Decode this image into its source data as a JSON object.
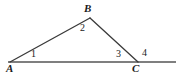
{
  "figure": {
    "background_color": "#ffffff",
    "stroke_color": "#3a3a3a",
    "base_line_color": "#555555",
    "text_color": "#1b1b1b",
    "width": 181,
    "height": 75
  },
  "vertices": [
    {
      "id": "A",
      "label": "A",
      "x": 10,
      "y": 62
    },
    {
      "id": "B",
      "label": "B",
      "x": 90,
      "y": 18
    },
    {
      "id": "C",
      "label": "C",
      "x": 138,
      "y": 62
    }
  ],
  "angles": [
    {
      "id": "angle1",
      "label": "1",
      "at_vertex": "A",
      "kind": "interior",
      "x": 34,
      "y": 54
    },
    {
      "id": "angle2",
      "label": "2",
      "at_vertex": "B",
      "kind": "interior",
      "x": 83,
      "y": 28
    },
    {
      "id": "angle3",
      "label": "3",
      "at_vertex": "C",
      "kind": "interior",
      "x": 119,
      "y": 54
    },
    {
      "id": "angle4",
      "label": "4",
      "at_vertex": "C",
      "kind": "exterior",
      "x": 145,
      "y": 53
    }
  ],
  "segments": [
    {
      "id": "side-AB",
      "from": "A",
      "to": "B",
      "x1": 10,
      "y1": 62,
      "x2": 90,
      "y2": 18
    },
    {
      "id": "side-BC",
      "from": "B",
      "to": "C",
      "x1": 90,
      "y1": 18,
      "x2": 138,
      "y2": 62
    },
    {
      "id": "base-line",
      "from": "left-end",
      "to": "right-end",
      "x1": 8,
      "y1": 62,
      "x2": 176,
      "y2": 62
    }
  ],
  "chart_data": {
    "type": "diagram",
    "points": {
      "A": [
        10,
        62
      ],
      "B": [
        90,
        18
      ],
      "C": [
        138,
        62
      ],
      "base_left_end": [
        8,
        62
      ],
      "base_right_end": [
        176,
        62
      ]
    },
    "edges": [
      [
        "A",
        "B"
      ],
      [
        "B",
        "C"
      ],
      [
        "base_left_end",
        "base_right_end"
      ]
    ],
    "annotations": [
      {
        "text": "A",
        "x": 10,
        "y": 70,
        "role": "vertex-label"
      },
      {
        "text": "B",
        "x": 88,
        "y": 10,
        "role": "vertex-label"
      },
      {
        "text": "C",
        "x": 136,
        "y": 70,
        "role": "vertex-label"
      },
      {
        "text": "1",
        "x": 34,
        "y": 56,
        "role": "angle-number"
      },
      {
        "text": "2",
        "x": 83,
        "y": 30,
        "role": "angle-number"
      },
      {
        "text": "3",
        "x": 119,
        "y": 56,
        "role": "angle-number"
      },
      {
        "text": "4",
        "x": 145,
        "y": 55,
        "role": "angle-number"
      }
    ],
    "xlim": [
      0,
      181
    ],
    "ylim": [
      75,
      0
    ],
    "grid": false,
    "legend": false
  }
}
